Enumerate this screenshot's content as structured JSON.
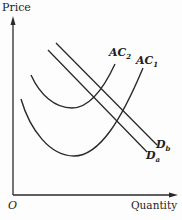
{
  "diagram": {
    "type": "economics-cost-demand-diagram",
    "y_axis_label": "Price",
    "x_axis_label": "Quantity",
    "origin_label": "O",
    "curves": [
      {
        "id": "AC2",
        "label_main": "AC",
        "label_sub": "2",
        "kind": "average-cost U-curve (upper)"
      },
      {
        "id": "AC1",
        "label_main": "AC",
        "label_sub": "1",
        "kind": "average-cost U-curve (lower)"
      },
      {
        "id": "Db",
        "label_main": "D",
        "label_sub": "b",
        "kind": "demand line (upper)"
      },
      {
        "id": "Da",
        "label_main": "D",
        "label_sub": "a",
        "kind": "demand line (lower)"
      }
    ],
    "colors": {
      "ink": "#2a2a2a",
      "background": "#fdfdfd"
    }
  }
}
